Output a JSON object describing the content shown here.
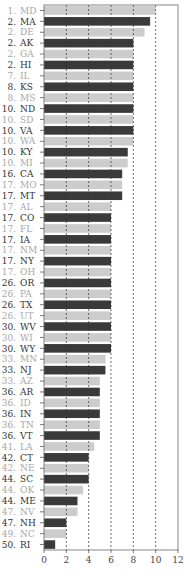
{
  "chart_data": {
    "type": "bar",
    "orientation": "horizontal",
    "title": "",
    "xlabel": "",
    "ylabel": "",
    "xlim": [
      0,
      12
    ],
    "xticks": [
      0,
      2,
      4,
      6,
      8,
      10,
      12
    ],
    "grid": "vertical dashed at 2,4,6,8,10",
    "colors": {
      "dark": "#3a3a3a",
      "light": "#cccccc",
      "label_dark": "#333333",
      "label_light": "#a8a8a8"
    },
    "rows": [
      {
        "rank": "1.",
        "state": "MD",
        "value": 10.0,
        "shade": "light"
      },
      {
        "rank": "2.",
        "state": "MA",
        "value": 9.5,
        "shade": "dark"
      },
      {
        "rank": "2.",
        "state": "DE",
        "value": 9.0,
        "shade": "light"
      },
      {
        "rank": "2.",
        "state": "AK",
        "value": 8.0,
        "shade": "dark"
      },
      {
        "rank": "2.",
        "state": "GA",
        "value": 8.0,
        "shade": "light"
      },
      {
        "rank": "2.",
        "state": "HI",
        "value": 8.0,
        "shade": "dark"
      },
      {
        "rank": "7.",
        "state": "IL",
        "value": 8.0,
        "shade": "light"
      },
      {
        "rank": "8.",
        "state": "KS",
        "value": 8.0,
        "shade": "dark"
      },
      {
        "rank": "8.",
        "state": "MS",
        "value": 8.0,
        "shade": "light"
      },
      {
        "rank": "10.",
        "state": "ND",
        "value": 8.0,
        "shade": "dark"
      },
      {
        "rank": "10.",
        "state": "SD",
        "value": 8.0,
        "shade": "light"
      },
      {
        "rank": "10.",
        "state": "VA",
        "value": 8.0,
        "shade": "dark"
      },
      {
        "rank": "10.",
        "state": "WA",
        "value": 8.0,
        "shade": "light"
      },
      {
        "rank": "10.",
        "state": "KY",
        "value": 7.5,
        "shade": "dark"
      },
      {
        "rank": "10.",
        "state": "MI",
        "value": 7.5,
        "shade": "light"
      },
      {
        "rank": "16.",
        "state": "CA",
        "value": 7.0,
        "shade": "dark"
      },
      {
        "rank": "17.",
        "state": "MO",
        "value": 7.0,
        "shade": "light"
      },
      {
        "rank": "17.",
        "state": "MT",
        "value": 7.0,
        "shade": "dark"
      },
      {
        "rank": "17.",
        "state": "AL",
        "value": 6.0,
        "shade": "light"
      },
      {
        "rank": "17.",
        "state": "CO",
        "value": 6.0,
        "shade": "dark"
      },
      {
        "rank": "17.",
        "state": "FL",
        "value": 6.0,
        "shade": "light"
      },
      {
        "rank": "17.",
        "state": "IA",
        "value": 6.0,
        "shade": "dark"
      },
      {
        "rank": "17.",
        "state": "NM",
        "value": 6.0,
        "shade": "light"
      },
      {
        "rank": "17.",
        "state": "NY",
        "value": 6.0,
        "shade": "dark"
      },
      {
        "rank": "17.",
        "state": "OH",
        "value": 6.0,
        "shade": "light"
      },
      {
        "rank": "26.",
        "state": "OR",
        "value": 6.0,
        "shade": "dark"
      },
      {
        "rank": "26.",
        "state": "PA",
        "value": 6.0,
        "shade": "light"
      },
      {
        "rank": "26.",
        "state": "TX",
        "value": 6.0,
        "shade": "dark"
      },
      {
        "rank": "26.",
        "state": "UT",
        "value": 6.0,
        "shade": "light"
      },
      {
        "rank": "30.",
        "state": "WV",
        "value": 6.0,
        "shade": "dark"
      },
      {
        "rank": "30.",
        "state": "WI",
        "value": 6.0,
        "shade": "light"
      },
      {
        "rank": "30.",
        "state": "WY",
        "value": 6.0,
        "shade": "dark"
      },
      {
        "rank": "33.",
        "state": "MN",
        "value": 5.5,
        "shade": "light"
      },
      {
        "rank": "33.",
        "state": "NJ",
        "value": 5.5,
        "shade": "dark"
      },
      {
        "rank": "33.",
        "state": "AZ",
        "value": 5.0,
        "shade": "light"
      },
      {
        "rank": "36.",
        "state": "AR",
        "value": 5.0,
        "shade": "dark"
      },
      {
        "rank": "36.",
        "state": "ID",
        "value": 5.0,
        "shade": "light"
      },
      {
        "rank": "36.",
        "state": "IN",
        "value": 5.0,
        "shade": "dark"
      },
      {
        "rank": "36.",
        "state": "TN",
        "value": 5.0,
        "shade": "light"
      },
      {
        "rank": "36.",
        "state": "VT",
        "value": 5.0,
        "shade": "dark"
      },
      {
        "rank": "41.",
        "state": "LA",
        "value": 4.5,
        "shade": "light"
      },
      {
        "rank": "42.",
        "state": "CT",
        "value": 4.0,
        "shade": "dark"
      },
      {
        "rank": "42.",
        "state": "NE",
        "value": 4.0,
        "shade": "light"
      },
      {
        "rank": "44.",
        "state": "SC",
        "value": 4.0,
        "shade": "dark"
      },
      {
        "rank": "44.",
        "state": "OK",
        "value": 3.5,
        "shade": "light"
      },
      {
        "rank": "44.",
        "state": "ME",
        "value": 3.0,
        "shade": "dark"
      },
      {
        "rank": "47.",
        "state": "NV",
        "value": 3.0,
        "shade": "light"
      },
      {
        "rank": "47.",
        "state": "NH",
        "value": 2.0,
        "shade": "dark"
      },
      {
        "rank": "49.",
        "state": "NC",
        "value": 2.0,
        "shade": "light"
      },
      {
        "rank": "50.",
        "state": "RI",
        "value": 1.0,
        "shade": "dark"
      }
    ]
  }
}
